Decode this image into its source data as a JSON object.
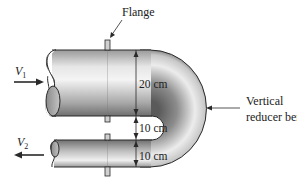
{
  "figure": {
    "labels": {
      "flange": "Flange",
      "bend_line1": "Vertical",
      "bend_line2": "reducer bend"
    },
    "velocities": {
      "inlet_symbol": "V",
      "inlet_subscript": "1",
      "outlet_symbol": "V",
      "outlet_subscript": "2"
    },
    "dimensions": {
      "inlet_diameter": "20 cm",
      "gap": "10 cm",
      "outlet_diameter": "10 cm"
    },
    "colors": {
      "outline": "#2a2a2a",
      "pipe_light": "#f2f2f2",
      "pipe_dark": "#7a7a7a",
      "text": "#222222"
    }
  }
}
